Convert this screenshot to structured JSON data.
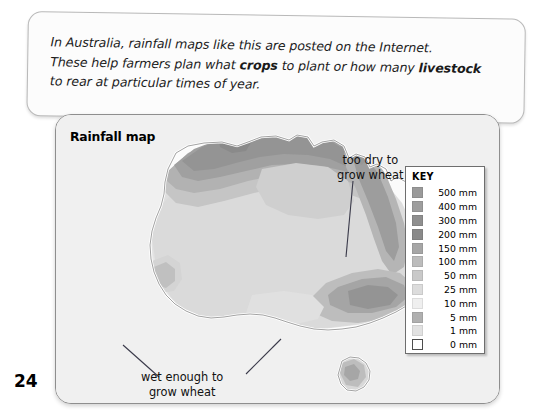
{
  "caption": {
    "line1_a": "In Australia, rainfall maps like this are posted on the Internet.",
    "line2_a": "These help farmers plan what ",
    "line2_b": "crops",
    "line2_c": " to plant or how many ",
    "line2_d": "livestock",
    "line3_a": "to rear at particular times of year."
  },
  "map": {
    "title": "Rainfall map",
    "annotations": {
      "dry_line1": "too dry to",
      "dry_line2": "grow wheat",
      "wet_line1": "wet enough to",
      "wet_line2": "grow wheat"
    }
  },
  "key": {
    "title": "KEY",
    "items": [
      {
        "label": "500 mm",
        "color": "#9a9a9a"
      },
      {
        "label": "400 mm",
        "color": "#9e9e9e"
      },
      {
        "label": "300 mm",
        "color": "#8f8f8f"
      },
      {
        "label": "200 mm",
        "color": "#8a8a8a"
      },
      {
        "label": "150 mm",
        "color": "#a6a6a6"
      },
      {
        "label": "100 mm",
        "color": "#bcbcbc"
      },
      {
        "label": "50 mm",
        "color": "#c9c9c9"
      },
      {
        "label": "25 mm",
        "color": "#dcdcdc"
      },
      {
        "label": "10 mm",
        "color": "#efefef"
      },
      {
        "label": "5 mm",
        "color": "#b0b0b0"
      },
      {
        "label": "1 mm",
        "color": "#e2e2e2"
      },
      {
        "label": "0 mm",
        "color": "#ffffff"
      }
    ]
  },
  "page": {
    "number": "24"
  },
  "colors": {
    "page_bg": "#ffffff",
    "card_bg": "#fcfcfc",
    "map_bg": "#f1f1f1",
    "map_border": "#8e8e8e",
    "text": "#111111"
  }
}
